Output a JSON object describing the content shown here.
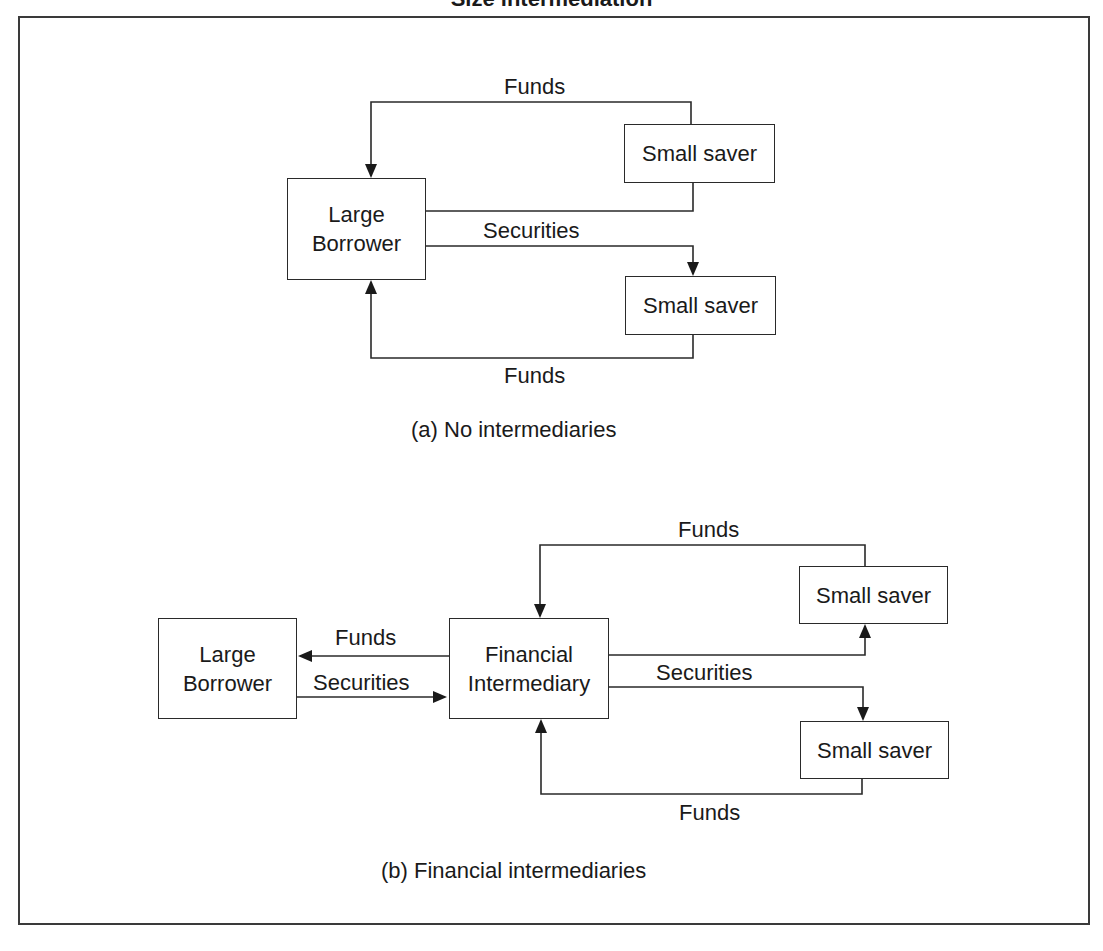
{
  "figure": {
    "title": "Size intermediation"
  },
  "panel_a": {
    "caption": "(a) No intermediaries",
    "nodes": {
      "large_borrower": "Large\nBorrower",
      "saver_top": "Small saver",
      "saver_bottom": "Small saver"
    },
    "edges": {
      "funds_top": "Funds",
      "securities": "Securities",
      "funds_bottom": "Funds"
    }
  },
  "panel_b": {
    "caption": "(b) Financial intermediaries",
    "nodes": {
      "large_borrower": "Large\nBorrower",
      "intermediary": "Financial\nIntermediary",
      "saver_top": "Small saver",
      "saver_bottom": "Small saver"
    },
    "edges": {
      "funds_to_borrower": "Funds",
      "securities_to_intermediary": "Securities",
      "funds_top": "Funds",
      "securities_to_savers": "Securities",
      "funds_bottom": "Funds"
    }
  },
  "colors": {
    "line": "#2a2a2a",
    "background": "#ffffff",
    "text": "#1a1a1a"
  }
}
